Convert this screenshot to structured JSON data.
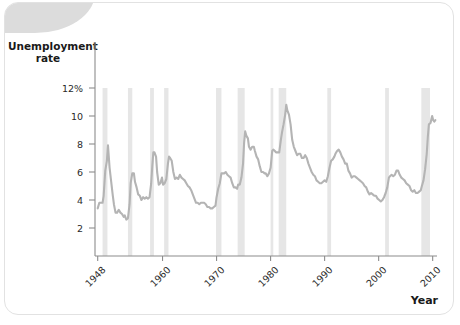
{
  "figure": {
    "y_axis_title": "Unemployment\nrate",
    "x_axis_title": "Year"
  },
  "chart_data": {
    "type": "line",
    "title": "Unemployment rate",
    "xlabel": "Year",
    "ylabel": "Unemployment rate",
    "xlim": [
      1947.5,
      2010.8
    ],
    "ylim": [
      0,
      13
    ],
    "grid": false,
    "legend": null,
    "y_ticks": [
      {
        "value": 12,
        "label": "12%"
      },
      {
        "value": 10,
        "label": "10"
      },
      {
        "value": 8,
        "label": "8"
      },
      {
        "value": 6,
        "label": "6"
      },
      {
        "value": 4,
        "label": "4"
      },
      {
        "value": 2,
        "label": "2"
      }
    ],
    "x_ticks": [
      {
        "value": 1948,
        "label": "1948"
      },
      {
        "value": 1960,
        "label": "1960"
      },
      {
        "value": 1970,
        "label": "1970"
      },
      {
        "value": 1980,
        "label": "1980"
      },
      {
        "value": 1990,
        "label": "1990"
      },
      {
        "value": 2000,
        "label": "2000"
      },
      {
        "value": 2010,
        "label": "2010"
      }
    ],
    "line_color": "#b4b4b4",
    "recession_band_color": "#e6e6e6",
    "recession_bands": [
      {
        "start": 1948.9,
        "end": 1949.8
      },
      {
        "start": 1953.6,
        "end": 1954.4
      },
      {
        "start": 1957.7,
        "end": 1958.4
      },
      {
        "start": 1960.3,
        "end": 1961.1
      },
      {
        "start": 1969.9,
        "end": 1970.9
      },
      {
        "start": 1973.9,
        "end": 1975.2
      },
      {
        "start": 1980.0,
        "end": 1980.5
      },
      {
        "start": 1981.5,
        "end": 1982.9
      },
      {
        "start": 1990.5,
        "end": 1991.2
      },
      {
        "start": 2001.2,
        "end": 2001.9
      },
      {
        "start": 2007.9,
        "end": 2009.5
      }
    ],
    "series": [
      {
        "name": "Unemployment rate",
        "points": [
          [
            1948.0,
            3.4
          ],
          [
            1948.3,
            3.8
          ],
          [
            1948.6,
            3.8
          ],
          [
            1948.9,
            3.8
          ],
          [
            1949.1,
            4.3
          ],
          [
            1949.4,
            6.1
          ],
          [
            1949.7,
            6.8
          ],
          [
            1949.9,
            7.9
          ],
          [
            1950.2,
            6.3
          ],
          [
            1950.5,
            5.3
          ],
          [
            1950.8,
            4.3
          ],
          [
            1951.0,
            3.7
          ],
          [
            1951.3,
            3.1
          ],
          [
            1951.6,
            3.1
          ],
          [
            1951.9,
            3.3
          ],
          [
            1952.2,
            3.1
          ],
          [
            1952.5,
            3.0
          ],
          [
            1952.8,
            2.8
          ],
          [
            1953.0,
            2.9
          ],
          [
            1953.3,
            2.6
          ],
          [
            1953.6,
            2.7
          ],
          [
            1953.9,
            3.7
          ],
          [
            1954.1,
            5.2
          ],
          [
            1954.4,
            5.9
          ],
          [
            1954.7,
            5.9
          ],
          [
            1954.9,
            5.3
          ],
          [
            1955.2,
            4.9
          ],
          [
            1955.5,
            4.4
          ],
          [
            1955.8,
            4.3
          ],
          [
            1956.1,
            4.0
          ],
          [
            1956.4,
            4.2
          ],
          [
            1956.7,
            4.1
          ],
          [
            1957.0,
            4.2
          ],
          [
            1957.3,
            4.1
          ],
          [
            1957.6,
            4.2
          ],
          [
            1957.9,
            5.2
          ],
          [
            1958.1,
            6.4
          ],
          [
            1958.3,
            7.4
          ],
          [
            1958.5,
            7.4
          ],
          [
            1958.8,
            7.1
          ],
          [
            1959.0,
            6.0
          ],
          [
            1959.3,
            5.1
          ],
          [
            1959.6,
            5.2
          ],
          [
            1959.9,
            5.6
          ],
          [
            1960.1,
            5.1
          ],
          [
            1960.4,
            5.2
          ],
          [
            1960.7,
            5.5
          ],
          [
            1961.0,
            6.6
          ],
          [
            1961.2,
            7.1
          ],
          [
            1961.4,
            7.0
          ],
          [
            1961.7,
            6.8
          ],
          [
            1962.0,
            6.0
          ],
          [
            1962.3,
            5.5
          ],
          [
            1962.6,
            5.6
          ],
          [
            1962.9,
            5.5
          ],
          [
            1963.2,
            5.8
          ],
          [
            1963.5,
            5.6
          ],
          [
            1963.8,
            5.5
          ],
          [
            1964.1,
            5.4
          ],
          [
            1964.4,
            5.2
          ],
          [
            1964.7,
            5.0
          ],
          [
            1965.0,
            4.9
          ],
          [
            1965.3,
            4.7
          ],
          [
            1965.6,
            4.4
          ],
          [
            1965.9,
            4.1
          ],
          [
            1966.2,
            3.8
          ],
          [
            1966.5,
            3.8
          ],
          [
            1966.8,
            3.7
          ],
          [
            1967.1,
            3.8
          ],
          [
            1967.4,
            3.8
          ],
          [
            1967.7,
            3.8
          ],
          [
            1968.0,
            3.7
          ],
          [
            1968.3,
            3.5
          ],
          [
            1968.6,
            3.5
          ],
          [
            1968.9,
            3.4
          ],
          [
            1969.2,
            3.4
          ],
          [
            1969.5,
            3.5
          ],
          [
            1969.8,
            3.6
          ],
          [
            1970.0,
            4.2
          ],
          [
            1970.3,
            4.8
          ],
          [
            1970.6,
            5.2
          ],
          [
            1970.9,
            5.9
          ],
          [
            1971.1,
            5.9
          ],
          [
            1971.4,
            5.9
          ],
          [
            1971.7,
            6.0
          ],
          [
            1972.0,
            5.8
          ],
          [
            1972.3,
            5.7
          ],
          [
            1972.6,
            5.6
          ],
          [
            1972.9,
            5.2
          ],
          [
            1973.2,
            4.9
          ],
          [
            1973.5,
            4.9
          ],
          [
            1973.8,
            4.8
          ],
          [
            1974.0,
            5.1
          ],
          [
            1974.3,
            5.1
          ],
          [
            1974.6,
            5.6
          ],
          [
            1974.9,
            6.6
          ],
          [
            1975.1,
            8.1
          ],
          [
            1975.3,
            8.9
          ],
          [
            1975.5,
            8.6
          ],
          [
            1975.8,
            8.4
          ],
          [
            1976.0,
            7.8
          ],
          [
            1976.3,
            7.6
          ],
          [
            1976.6,
            7.8
          ],
          [
            1976.9,
            7.8
          ],
          [
            1977.1,
            7.5
          ],
          [
            1977.4,
            7.1
          ],
          [
            1977.7,
            6.9
          ],
          [
            1978.0,
            6.4
          ],
          [
            1978.3,
            6.0
          ],
          [
            1978.6,
            6.0
          ],
          [
            1978.9,
            5.9
          ],
          [
            1979.1,
            5.9
          ],
          [
            1979.4,
            5.7
          ],
          [
            1979.7,
            5.9
          ],
          [
            1980.0,
            6.3
          ],
          [
            1980.3,
            7.5
          ],
          [
            1980.5,
            7.6
          ],
          [
            1980.8,
            7.5
          ],
          [
            1981.0,
            7.4
          ],
          [
            1981.3,
            7.4
          ],
          [
            1981.6,
            7.4
          ],
          [
            1981.9,
            8.3
          ],
          [
            1982.1,
            8.8
          ],
          [
            1982.4,
            9.4
          ],
          [
            1982.7,
            10.1
          ],
          [
            1982.9,
            10.8
          ],
          [
            1983.1,
            10.4
          ],
          [
            1983.4,
            10.1
          ],
          [
            1983.7,
            9.4
          ],
          [
            1984.0,
            8.3
          ],
          [
            1984.3,
            7.8
          ],
          [
            1984.6,
            7.5
          ],
          [
            1984.9,
            7.2
          ],
          [
            1985.2,
            7.3
          ],
          [
            1985.5,
            7.3
          ],
          [
            1985.8,
            7.0
          ],
          [
            1986.1,
            7.0
          ],
          [
            1986.4,
            7.2
          ],
          [
            1986.7,
            7.0
          ],
          [
            1987.0,
            6.6
          ],
          [
            1987.3,
            6.3
          ],
          [
            1987.6,
            6.0
          ],
          [
            1987.9,
            5.8
          ],
          [
            1988.2,
            5.7
          ],
          [
            1988.5,
            5.4
          ],
          [
            1988.8,
            5.3
          ],
          [
            1989.1,
            5.2
          ],
          [
            1989.4,
            5.2
          ],
          [
            1989.7,
            5.3
          ],
          [
            1990.0,
            5.4
          ],
          [
            1990.3,
            5.3
          ],
          [
            1990.6,
            5.7
          ],
          [
            1990.9,
            6.3
          ],
          [
            1991.2,
            6.8
          ],
          [
            1991.5,
            6.9
          ],
          [
            1991.8,
            7.1
          ],
          [
            1992.0,
            7.3
          ],
          [
            1992.3,
            7.5
          ],
          [
            1992.6,
            7.6
          ],
          [
            1992.9,
            7.4
          ],
          [
            1993.2,
            7.1
          ],
          [
            1993.5,
            6.9
          ],
          [
            1993.8,
            6.6
          ],
          [
            1994.1,
            6.6
          ],
          [
            1994.4,
            6.1
          ],
          [
            1994.7,
            5.9
          ],
          [
            1995.0,
            5.6
          ],
          [
            1995.3,
            5.7
          ],
          [
            1995.6,
            5.7
          ],
          [
            1995.9,
            5.6
          ],
          [
            1996.2,
            5.5
          ],
          [
            1996.5,
            5.4
          ],
          [
            1996.8,
            5.3
          ],
          [
            1997.1,
            5.2
          ],
          [
            1997.4,
            5.0
          ],
          [
            1997.7,
            4.9
          ],
          [
            1998.0,
            4.6
          ],
          [
            1998.3,
            4.4
          ],
          [
            1998.6,
            4.5
          ],
          [
            1998.9,
            4.4
          ],
          [
            1999.2,
            4.3
          ],
          [
            1999.5,
            4.3
          ],
          [
            1999.8,
            4.1
          ],
          [
            2000.1,
            4.0
          ],
          [
            2000.4,
            3.9
          ],
          [
            2000.7,
            4.0
          ],
          [
            2001.0,
            4.2
          ],
          [
            2001.3,
            4.5
          ],
          [
            2001.6,
            4.9
          ],
          [
            2001.9,
            5.6
          ],
          [
            2002.1,
            5.7
          ],
          [
            2002.4,
            5.8
          ],
          [
            2002.7,
            5.7
          ],
          [
            2003.0,
            5.8
          ],
          [
            2003.3,
            6.1
          ],
          [
            2003.6,
            6.1
          ],
          [
            2003.9,
            5.8
          ],
          [
            2004.2,
            5.6
          ],
          [
            2004.5,
            5.5
          ],
          [
            2004.8,
            5.4
          ],
          [
            2005.1,
            5.2
          ],
          [
            2005.4,
            5.1
          ],
          [
            2005.7,
            5.0
          ],
          [
            2006.0,
            4.7
          ],
          [
            2006.3,
            4.6
          ],
          [
            2006.6,
            4.7
          ],
          [
            2006.9,
            4.5
          ],
          [
            2007.2,
            4.5
          ],
          [
            2007.5,
            4.6
          ],
          [
            2007.8,
            4.7
          ],
          [
            2008.0,
            5.0
          ],
          [
            2008.3,
            5.4
          ],
          [
            2008.6,
            6.2
          ],
          [
            2008.9,
            7.3
          ],
          [
            2009.1,
            8.5
          ],
          [
            2009.3,
            9.4
          ],
          [
            2009.6,
            9.5
          ],
          [
            2009.9,
            10.0
          ],
          [
            2010.1,
            9.7
          ],
          [
            2010.3,
            9.6
          ],
          [
            2010.5,
            9.7
          ]
        ]
      }
    ]
  }
}
